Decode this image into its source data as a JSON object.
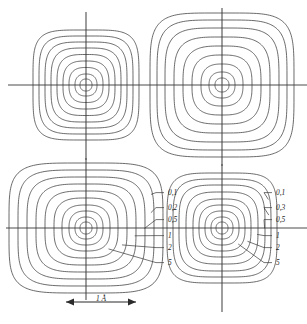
{
  "figure": {
    "scale_bar": {
      "label": "1 Å",
      "x_start": 66,
      "x_end": 136,
      "y": 302
    }
  },
  "chart_data": {
    "type": "contour",
    "subtitle": "",
    "xlabel": "",
    "ylabel": "",
    "grid": false,
    "legend_position": "inline-right",
    "scale_bar_label": "1 Å",
    "scale_bar_length_angstrom": 1,
    "panel_count": 4,
    "panels": [
      {
        "id": "top-left",
        "name": "panel-top-left",
        "center_x": 86,
        "center_y": 85,
        "half_width": 54,
        "half_height": 56,
        "ring_count": 9,
        "labels": [],
        "contour_levels": [
          0.1,
          0.2,
          0.5,
          1,
          2,
          5
        ],
        "ring_radii_x": [
          6,
          11,
          17,
          23,
          29,
          35,
          41,
          47,
          53
        ],
        "ring_radii_y": [
          6,
          11,
          17.5,
          24,
          30.5,
          37,
          43,
          49,
          55
        ],
        "squareness": [
          0.06,
          0.1,
          0.16,
          0.22,
          0.3,
          0.38,
          0.46,
          0.55,
          0.62
        ]
      },
      {
        "id": "top-right",
        "name": "panel-top-right",
        "center_x": 222,
        "center_y": 85,
        "half_width": 72,
        "half_height": 72,
        "ring_count": 9,
        "labels": [],
        "contour_levels": [
          0.1,
          0.2,
          0.5,
          1,
          2,
          5
        ],
        "ring_radii_x": [
          7,
          13,
          21,
          30,
          39,
          48,
          57,
          65,
          72
        ],
        "ring_radii_y": [
          7,
          13,
          21,
          30,
          39,
          48,
          57,
          65,
          72
        ],
        "squareness": [
          0.05,
          0.09,
          0.15,
          0.22,
          0.3,
          0.4,
          0.5,
          0.58,
          0.65
        ]
      },
      {
        "id": "bottom-left",
        "name": "panel-bottom-left",
        "center_x": 86,
        "center_y": 228,
        "half_width": 77,
        "half_height": 66,
        "ring_count": 10,
        "labels": [
          "0,1",
          "0,2",
          "0,5",
          "1",
          "2",
          "5"
        ],
        "contour_levels": [
          0.1,
          0.2,
          0.5,
          1,
          2,
          5
        ],
        "ring_radii_x": [
          6,
          11,
          17,
          24,
          32,
          41,
          50,
          59,
          68,
          77
        ],
        "ring_radii_y": [
          6,
          11,
          17,
          23,
          30,
          37,
          44,
          51,
          58,
          65
        ],
        "squareness": [
          0.05,
          0.08,
          0.13,
          0.19,
          0.26,
          0.34,
          0.42,
          0.5,
          0.58,
          0.65
        ]
      },
      {
        "id": "bottom-right",
        "name": "panel-bottom-right",
        "center_x": 222,
        "center_y": 228,
        "half_width": 55,
        "half_height": 55,
        "ring_count": 9,
        "labels": [
          "0,1",
          "0,3",
          "0,5",
          "1",
          "2",
          "5"
        ],
        "contour_levels": [
          0.1,
          0.3,
          0.5,
          1,
          2,
          5
        ],
        "ring_radii_x": [
          6,
          11,
          17,
          23,
          29,
          36,
          43,
          49,
          55
        ],
        "ring_radii_y": [
          6,
          11,
          17,
          23,
          29,
          36,
          43,
          49,
          55
        ],
        "squareness": [
          0.05,
          0.09,
          0.14,
          0.2,
          0.28,
          0.36,
          0.45,
          0.54,
          0.62
        ]
      }
    ],
    "annotations": {
      "bottom_left_labels": [
        {
          "text": "0,1",
          "x": 168,
          "y": 195
        },
        {
          "text": "0,2",
          "x": 168,
          "y": 210
        },
        {
          "text": "0,5",
          "x": 168,
          "y": 222
        },
        {
          "text": "1",
          "x": 168,
          "y": 238
        },
        {
          "text": "2",
          "x": 168,
          "y": 250
        },
        {
          "text": "5",
          "x": 168,
          "y": 265
        }
      ],
      "bottom_right_labels": [
        {
          "text": "0,1",
          "x": 276,
          "y": 195
        },
        {
          "text": "0,3",
          "x": 276,
          "y": 210
        },
        {
          "text": "0,5",
          "x": 276,
          "y": 222
        },
        {
          "text": "1",
          "x": 276,
          "y": 238
        },
        {
          "text": "2",
          "x": 276,
          "y": 250
        },
        {
          "text": "5",
          "x": 276,
          "y": 265
        }
      ]
    }
  }
}
